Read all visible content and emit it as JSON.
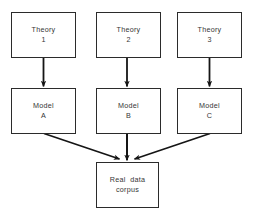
{
  "diagram": {
    "background_color": "#ffffff",
    "line_color": "#2b2b2b",
    "text_color": "#363636",
    "nodes": [
      {
        "id": "theory-1",
        "line1": "Theory",
        "line2": "1"
      },
      {
        "id": "theory-2",
        "line1": "Theory",
        "line2": "2"
      },
      {
        "id": "theory-3",
        "line1": "Theory",
        "line2": "3"
      },
      {
        "id": "model-a",
        "line1": "Model",
        "line2": "A"
      },
      {
        "id": "model-b",
        "line1": "Model",
        "line2": "B"
      },
      {
        "id": "model-c",
        "line1": "Model",
        "line2": "C"
      },
      {
        "id": "corpus",
        "line1": "Real  data",
        "line2": "corpus"
      }
    ],
    "theory_1": {
      "line1": "Theory",
      "line2": "1"
    },
    "theory_2": {
      "line1": "Theory",
      "line2": "2"
    },
    "theory_3": {
      "line1": "Theory",
      "line2": "3"
    },
    "model_a": {
      "line1": "Model",
      "line2": "A"
    },
    "model_b": {
      "line1": "Model",
      "line2": "B"
    },
    "model_c": {
      "line1": "Model",
      "line2": "C"
    },
    "corpus": {
      "line1": "Real  data",
      "line2": "corpus"
    },
    "edges": [
      {
        "id": "arrow-theory1-model-a",
        "from": "theory-1",
        "to": "model-a",
        "shape": "vertical"
      },
      {
        "id": "arrow-theory2-model-b",
        "from": "theory-2",
        "to": "model-b",
        "shape": "vertical"
      },
      {
        "id": "arrow-theory3-model-c",
        "from": "theory-3",
        "to": "model-c",
        "shape": "vertical"
      },
      {
        "id": "arrow-model-a-corpus",
        "from": "model-a",
        "to": "corpus",
        "shape": "diagonal"
      },
      {
        "id": "arrow-model-b-corpus",
        "from": "model-b",
        "to": "corpus",
        "shape": "vertical"
      },
      {
        "id": "arrow-model-c-corpus",
        "from": "model-c",
        "to": "corpus",
        "shape": "diagonal"
      }
    ]
  }
}
